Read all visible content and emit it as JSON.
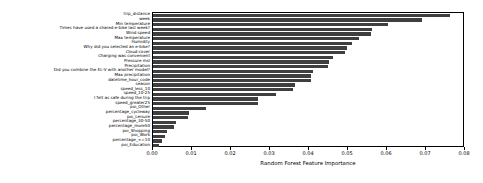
{
  "chart_data": {
    "type": "bar",
    "orientation": "horizontal",
    "title": "",
    "xlabel": "Random Forest Feature Importance",
    "ylabel": "",
    "xlim": [
      0.0,
      0.08
    ],
    "xticks": [
      "0.00",
      "0.01",
      "0.02",
      "0.03",
      "0.04",
      "0.05",
      "0.06",
      "0.07",
      "0.08"
    ],
    "xtick_values": [
      0.0,
      0.01,
      0.02,
      0.03,
      0.04,
      0.05,
      0.06,
      0.07,
      0.08
    ],
    "grid": false,
    "legend": null,
    "bar_color": "#3f3f3f",
    "categories": [
      "trip_distance",
      "week",
      "Min temperature",
      "Times have used a shared e-bike last week?",
      "Wind speed",
      "Max temperature",
      "Humidity",
      "Why did you selected an e-bike?",
      "Cloud cover",
      "Charging was convenient",
      "Pressure msl",
      "Precipitation",
      "Did you combine the EL-V with another model?",
      "Max precipitation",
      "datetime_hour_code",
      "season",
      "speed_less_10",
      "speed_10-25",
      "I felt as safe during the trip",
      "speed_greater25",
      "poi_Other",
      "percentage_cycleway",
      "poi_Leisure",
      "percentage_30-50",
      "percentage_more50",
      "poi_Shopping",
      "poi_Work",
      "percentage_<=10",
      "poi_Education"
    ],
    "values": [
      0.0762,
      0.069,
      0.0602,
      0.0562,
      0.0558,
      0.0528,
      0.051,
      0.0498,
      0.0492,
      0.0462,
      0.0452,
      0.0448,
      0.041,
      0.0406,
      0.0404,
      0.0364,
      0.0358,
      0.0316,
      0.0268,
      0.0268,
      0.0136,
      0.0092,
      0.009,
      0.006,
      0.0054,
      0.0036,
      0.003,
      0.0024,
      0.0016
    ]
  }
}
